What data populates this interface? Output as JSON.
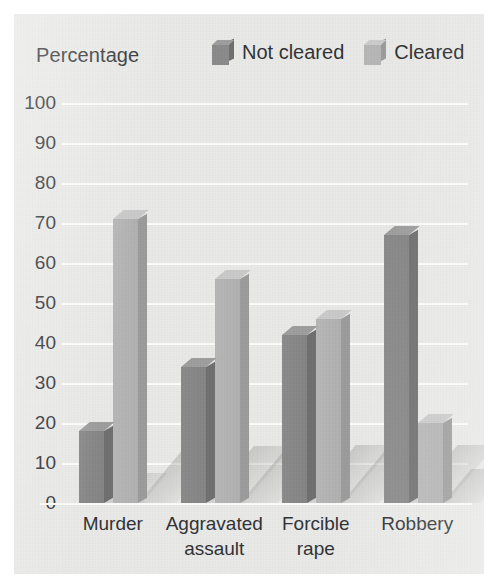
{
  "axis_title": "Percentage",
  "legend": {
    "items": [
      {
        "label": "Not cleared",
        "swatch": "cube-icon-dark",
        "color": "#8a8a8a"
      },
      {
        "label": "Cleared",
        "swatch": "cube-icon-light",
        "color": "#b6b6b6"
      }
    ]
  },
  "ticks": [
    "100",
    "90",
    "80",
    "70",
    "60",
    "50",
    "40",
    "30",
    "20",
    "10",
    "0"
  ],
  "categories": [
    {
      "line1": "Murder",
      "line2": ""
    },
    {
      "line1": "Aggravated",
      "line2": "assault"
    },
    {
      "line1": "Forcible",
      "line2": "rape"
    },
    {
      "line1": "Robbery",
      "line2": ""
    }
  ],
  "colors": {
    "background": "#e9e9e7",
    "gridline": "#fcfcfa",
    "not_cleared_front": "#8a8a8a",
    "not_cleared_side": "#6e6e6e",
    "not_cleared_top": "#9d9d9d",
    "cleared_front": "#b6b6b6",
    "cleared_side": "#9b9b9b",
    "cleared_top": "#c9c9c9",
    "text": "#2f3134"
  },
  "chart_data": {
    "type": "bar",
    "title": "",
    "subtitle": "",
    "xlabel": "",
    "ylabel": "Percentage",
    "ylim": [
      0,
      100
    ],
    "ytick_step": 10,
    "grid": true,
    "legend_position": "top-right",
    "three_d": true,
    "categories": [
      "Murder",
      "Aggravated assault",
      "Forcible rape",
      "Robbery"
    ],
    "series": [
      {
        "name": "Not cleared",
        "values": [
          18,
          34,
          42,
          67
        ]
      },
      {
        "name": "Cleared",
        "values": [
          71,
          56,
          46,
          20
        ]
      }
    ]
  }
}
